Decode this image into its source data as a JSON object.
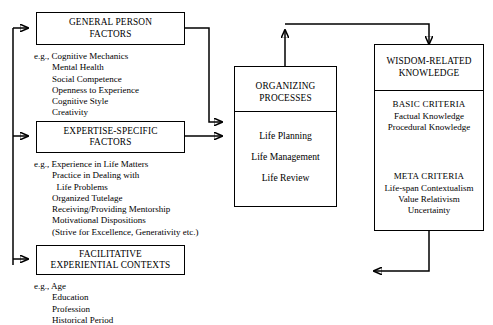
{
  "diagram": {
    "boxes": {
      "general_person": {
        "title": "GENERAL PERSON\nFACTORS",
        "examples": "e.g., Cognitive Mechanics\n        Mental Health\n        Social Competence\n        Openness to Experience\n        Cognitive Style\n        Creativity"
      },
      "expertise_specific": {
        "title": "EXPERTISE-SPECIFIC\nFACTORS",
        "examples": "e.g., Experience in Life Matters\n        Practice in Dealing with\n          Life Problems\n        Organized Tutelage\n        Receiving/Providing Mentorship\n        Motivational Dispositions\n        (Strive for Excellence, Generativity etc.)"
      },
      "facilitative": {
        "title": "FACILITATIVE\nEXPERIENTIAL CONTEXTS",
        "examples": "e.g., Age\n        Education\n        Profession\n        Historical Period"
      },
      "organizing_processes": {
        "title": "ORGANIZING\nPROCESSES",
        "items": [
          "Life Planning",
          "Life Management",
          "Life Review"
        ]
      },
      "wisdom_knowledge": {
        "title": "WISDOM-RELATED\nKNOWLEDGE",
        "basic_criteria": {
          "heading": "BASIC CRITERIA",
          "items": [
            "Factual Knowledge",
            "Procedural Knowledge"
          ]
        },
        "meta_criteria": {
          "heading": "META CRITERIA",
          "items": [
            "Life-span Contextualism",
            "Value Relativism",
            "Uncertainty"
          ]
        }
      }
    },
    "colors": {
      "stroke": "#000000",
      "background": "#ffffff"
    }
  }
}
